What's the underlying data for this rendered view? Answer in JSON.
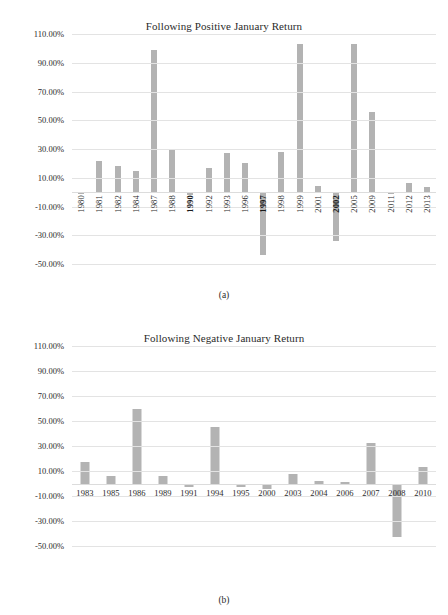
{
  "page": {
    "background": "#ffffff",
    "bar_color": "#b3b3b3",
    "grid_color": "#e3e3e3",
    "text_color": "#2b2b2b"
  },
  "captions": {
    "a": "(a)",
    "b": "(b)"
  },
  "chart_data": [
    {
      "type": "bar",
      "id": "a",
      "title": "Following Positive January Return",
      "xlabel": "",
      "ylabel": "",
      "ylim": [
        -50,
        110
      ],
      "ytick_labels": [
        "110.00%",
        "90.00%",
        "70.00%",
        "50.00%",
        "30.00%",
        "10.00%",
        "-10.00%",
        "-30.00%",
        "-50.00%"
      ],
      "yticks": [
        110,
        90,
        70,
        50,
        30,
        10,
        -10,
        -30,
        -50
      ],
      "grid": true,
      "legend": "none",
      "bold_categories": [
        "1990",
        "1997",
        "2002"
      ],
      "categories": [
        "1980",
        "1981",
        "1982",
        "1984",
        "1987",
        "1988",
        "1990",
        "1992",
        "1993",
        "1996",
        "1997",
        "1998",
        "1999",
        "2001",
        "2002",
        "2005",
        "2009",
        "2011",
        "2012",
        "2013"
      ],
      "values": [
        -1.0,
        21.5,
        18.5,
        15.0,
        99.0,
        29.0,
        -2.0,
        16.5,
        27.0,
        20.0,
        -44.0,
        28.0,
        103.0,
        4.0,
        -34.0,
        103.0,
        56.0,
        -1.5,
        6.5,
        3.5
      ]
    },
    {
      "type": "bar",
      "id": "b",
      "title": "Following Negative January Return",
      "xlabel": "",
      "ylabel": "",
      "ylim": [
        -50,
        110
      ],
      "ytick_labels": [
        "110.00%",
        "90.00%",
        "70.00%",
        "50.00%",
        "30.00%",
        "10.00%",
        "-10.00%",
        "-30.00%",
        "-50.00%"
      ],
      "yticks": [
        110,
        90,
        70,
        50,
        30,
        10,
        -10,
        -30,
        -50
      ],
      "grid": true,
      "legend": "none",
      "bold_categories": [],
      "categories": [
        "1983",
        "1985",
        "1986",
        "1989",
        "1991",
        "1994",
        "1995",
        "2000",
        "2003",
        "2004",
        "2006",
        "2007",
        "2008",
        "2010"
      ],
      "values": [
        17.5,
        6.0,
        60.0,
        6.0,
        -2.5,
        45.5,
        -2.5,
        -4.5,
        8.0,
        2.0,
        1.0,
        32.5,
        -43.0,
        13.0
      ]
    }
  ]
}
